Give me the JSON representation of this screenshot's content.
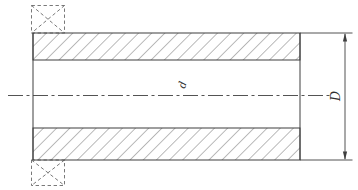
{
  "drawing": {
    "kind": "sectioned-tube-engineering-drawing",
    "labels": {
      "inner_diameter": "d",
      "outer_diameter": "D"
    },
    "colors": {
      "line": "#3f3f3f",
      "hatch": "#5f5f5f",
      "dashed": "#6a6a6a",
      "text": "#2f2f2f",
      "background": "#ffffff"
    }
  }
}
